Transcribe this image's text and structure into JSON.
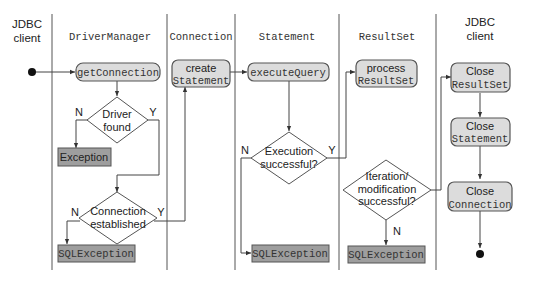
{
  "lanes": [
    {
      "id": "jdbc-client-left",
      "label_line1": "JDBC",
      "label_line2": "client"
    },
    {
      "id": "driver-manager",
      "label": "DriverManager"
    },
    {
      "id": "connection",
      "label": "Connection"
    },
    {
      "id": "statement",
      "label": "Statement"
    },
    {
      "id": "resultset",
      "label": "ResultSet"
    },
    {
      "id": "jdbc-client-right",
      "label_line1": "JDBC",
      "label_line2": "client"
    }
  ],
  "nodes": {
    "get_connection": "getConnection",
    "driver_found": {
      "line1": "Driver",
      "line2": "found"
    },
    "exception": "Exception",
    "connection_established": {
      "line1": "Connection",
      "line2": "established"
    },
    "sql_exception_1": "SQLException",
    "create_statement": {
      "line1": "create",
      "line2": "Statement"
    },
    "execute_query": "executeQuery",
    "execution_successful": {
      "line1": "Execution",
      "line2": "successful?"
    },
    "sql_exception_2": "SQLException",
    "process_resultset": {
      "line1": "process",
      "line2": "ResultSet"
    },
    "iteration_successful": {
      "line1": "Iteration/",
      "line2": "modification",
      "line3": "successful?"
    },
    "sql_exception_3": "SQLException",
    "close_resultset": {
      "line1": "Close",
      "line2": "ResultSet"
    },
    "close_statement": {
      "line1": "Close",
      "line2": "Statement"
    },
    "close_connection": {
      "line1": "Close",
      "line2": "Connection"
    }
  },
  "edge_labels": {
    "yes": "Y",
    "no": "N"
  }
}
